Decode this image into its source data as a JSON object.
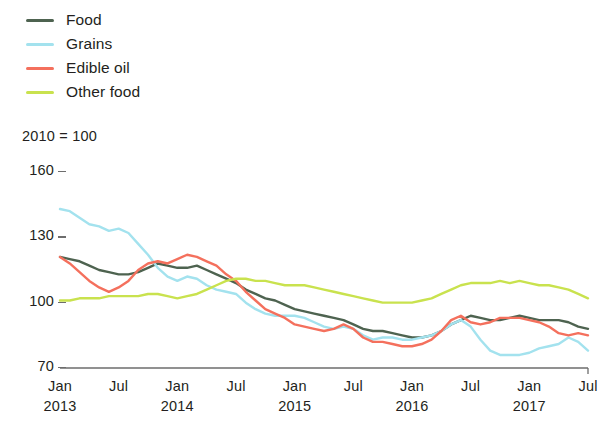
{
  "legend": {
    "items": [
      {
        "label": "Food",
        "color": "#4e6350",
        "swatch_icon": "line-swatch-icon"
      },
      {
        "label": "Grains",
        "color": "#a3e2ee",
        "swatch_icon": "line-swatch-icon"
      },
      {
        "label": "Edible oil",
        "color": "#f4705d",
        "swatch_icon": "line-swatch-icon"
      },
      {
        "label": "Other food",
        "color": "#c9e24e",
        "swatch_icon": "line-swatch-icon"
      }
    ]
  },
  "axis_note": "2010 = 100",
  "y_ticks": [
    "160",
    "130",
    "100",
    "70"
  ],
  "x_tick_months": [
    "Jan",
    "Jul",
    "Jan",
    "Jul",
    "Jan",
    "Jul",
    "Jan",
    "Jul",
    "Jan",
    "Jul"
  ],
  "x_tick_years": [
    "2013",
    "",
    "2014",
    "",
    "2015",
    "",
    "2016",
    "",
    "2017",
    ""
  ],
  "chart_data": {
    "type": "line",
    "title": "",
    "subtitle": "2010 = 100",
    "xlabel": "",
    "ylabel": "",
    "ylim": [
      70,
      160
    ],
    "y_ticks": [
      70,
      100,
      130,
      160
    ],
    "grid": false,
    "legend_position": "top-left",
    "x_start": "2013-01",
    "x_end": "2017-07",
    "x": [
      "2013-01",
      "2013-02",
      "2013-03",
      "2013-04",
      "2013-05",
      "2013-06",
      "2013-07",
      "2013-08",
      "2013-09",
      "2013-10",
      "2013-11",
      "2013-12",
      "2014-01",
      "2014-02",
      "2014-03",
      "2014-04",
      "2014-05",
      "2014-06",
      "2014-07",
      "2014-08",
      "2014-09",
      "2014-10",
      "2014-11",
      "2014-12",
      "2015-01",
      "2015-02",
      "2015-03",
      "2015-04",
      "2015-05",
      "2015-06",
      "2015-07",
      "2015-08",
      "2015-09",
      "2015-10",
      "2015-11",
      "2015-12",
      "2016-01",
      "2016-02",
      "2016-03",
      "2016-04",
      "2016-05",
      "2016-06",
      "2016-07",
      "2016-08",
      "2016-09",
      "2016-10",
      "2016-11",
      "2016-12",
      "2017-01",
      "2017-02",
      "2017-03",
      "2017-04",
      "2017-05",
      "2017-06",
      "2017-07"
    ],
    "series": [
      {
        "name": "Food",
        "color": "#4e6350",
        "values": [
          121,
          120,
          119,
          117,
          115,
          114,
          113,
          113,
          114,
          116,
          118,
          117,
          116,
          116,
          117,
          115,
          113,
          111,
          109,
          106,
          104,
          102,
          101,
          99,
          97,
          96,
          95,
          94,
          93,
          92,
          90,
          88,
          87,
          87,
          86,
          85,
          84,
          84,
          85,
          87,
          90,
          92,
          94,
          93,
          92,
          92,
          93,
          94,
          93,
          92,
          92,
          92,
          91,
          89,
          88
        ]
      },
      {
        "name": "Grains",
        "color": "#a3e2ee",
        "values": [
          143,
          142,
          139,
          136,
          135,
          133,
          134,
          132,
          127,
          122,
          116,
          112,
          110,
          112,
          111,
          108,
          106,
          105,
          104,
          100,
          97,
          95,
          94,
          94,
          94,
          93,
          91,
          89,
          88,
          89,
          88,
          85,
          83,
          84,
          84,
          83,
          83,
          84,
          85,
          87,
          90,
          92,
          89,
          83,
          78,
          76,
          76,
          76,
          77,
          79,
          80,
          81,
          84,
          82,
          78
        ]
      },
      {
        "name": "Edible oil",
        "color": "#f4705d",
        "values": [
          121,
          118,
          114,
          110,
          107,
          105,
          107,
          110,
          115,
          118,
          119,
          118,
          120,
          122,
          121,
          119,
          117,
          113,
          110,
          105,
          101,
          97,
          95,
          93,
          90,
          89,
          88,
          87,
          88,
          90,
          88,
          84,
          82,
          82,
          81,
          80,
          80,
          81,
          83,
          87,
          92,
          94,
          91,
          90,
          91,
          93,
          93,
          93,
          92,
          91,
          89,
          86,
          85,
          86,
          85
        ]
      },
      {
        "name": "Other food",
        "color": "#c9e24e",
        "values": [
          101,
          101,
          102,
          102,
          102,
          103,
          103,
          103,
          103,
          104,
          104,
          103,
          102,
          103,
          104,
          106,
          108,
          110,
          111,
          111,
          110,
          110,
          109,
          108,
          108,
          108,
          107,
          106,
          105,
          104,
          103,
          102,
          101,
          100,
          100,
          100,
          100,
          101,
          102,
          104,
          106,
          108,
          109,
          109,
          109,
          110,
          109,
          110,
          109,
          108,
          108,
          107,
          106,
          104,
          102
        ]
      }
    ]
  }
}
